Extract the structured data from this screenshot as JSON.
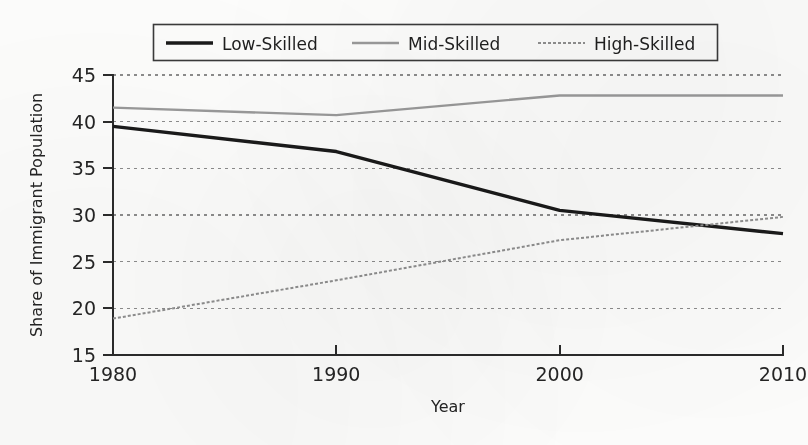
{
  "chart_data": {
    "type": "line",
    "title": "",
    "subtitle": "",
    "xlabel": "Year",
    "ylabel": "Share of Immigrant Population",
    "x": [
      1980,
      1990,
      2000,
      2010
    ],
    "xlim": [
      1980,
      2010
    ],
    "ylim": [
      15,
      45
    ],
    "xticks": [
      1980,
      1990,
      2000,
      2010
    ],
    "xtick_labels": [
      "1980",
      "1990",
      "2000",
      "2010"
    ],
    "yticks": [
      15,
      20,
      25,
      30,
      35,
      40,
      45
    ],
    "ytick_labels": [
      "15",
      "20",
      "25",
      "30",
      "35",
      "40",
      "45"
    ],
    "grid": true,
    "grid_axis": "y",
    "grid_style": "dotted",
    "legend_position": "upper center",
    "series": [
      {
        "name": "Low-Skilled",
        "values": [
          39.5,
          36.8,
          30.5,
          28.0
        ],
        "color": "#1a1a1a",
        "width": 3.4,
        "dash": "none"
      },
      {
        "name": "Mid-Skilled",
        "values": [
          41.5,
          40.7,
          42.8,
          42.8
        ],
        "color": "#9a9a9a",
        "width": 2.4,
        "dash": "none"
      },
      {
        "name": "High-Skilled",
        "values": [
          18.9,
          23.0,
          27.3,
          29.8
        ],
        "color": "#8f8f8f",
        "width": 2.0,
        "dash": "dotted"
      }
    ],
    "annotations": [
      {
        "text": "Low-Skilled and High-Skilled series cross near 2006 at about 29",
        "x": 2006,
        "y": 29
      }
    ]
  },
  "legend": {
    "items": [
      {
        "label": "Low-Skilled"
      },
      {
        "label": "Mid-Skilled"
      },
      {
        "label": "High-Skilled"
      }
    ]
  },
  "axes": {
    "x_title": "Year",
    "y_title": "Share of Immigrant Population",
    "x_tick_1": "1980",
    "x_tick_2": "1990",
    "x_tick_3": "2000",
    "x_tick_4": "2010",
    "y_tick_1": "15",
    "y_tick_2": "20",
    "y_tick_3": "25",
    "y_tick_4": "30",
    "y_tick_5": "35",
    "y_tick_6": "40",
    "y_tick_7": "45"
  },
  "colors": {
    "low_skilled": "#1a1a1a",
    "mid_skilled": "#9a9a9a",
    "high_skilled": "#8f8f8f",
    "grid": "#8c8c8c",
    "axis": "#2b2b2b",
    "background": "#fdfdfc"
  }
}
